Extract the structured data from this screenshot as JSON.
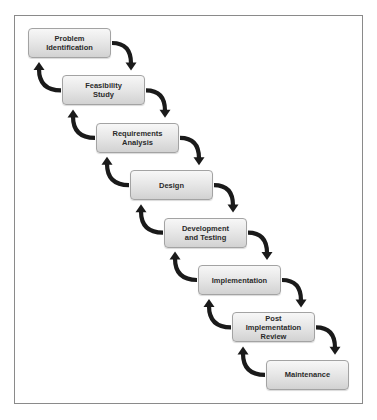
{
  "diagram": {
    "type": "waterfall-process",
    "steps": [
      {
        "label": "Problem\nIdentification"
      },
      {
        "label": "Feasibility\nStudy"
      },
      {
        "label": "Requirements\nAnalysis"
      },
      {
        "label": "Design"
      },
      {
        "label": "Development\nand Testing"
      },
      {
        "label": "Implementation"
      },
      {
        "label": "Post\nImplementation\nReview"
      },
      {
        "label": "Maintenance"
      }
    ],
    "colors": {
      "arrow": "#1a1a1a",
      "box_border": "#a3a3a3",
      "text": "#2a2a2a",
      "frame": "#8a8a8a"
    }
  }
}
